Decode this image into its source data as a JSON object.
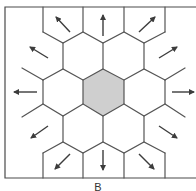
{
  "figure": {
    "panel_label": "B",
    "colors": {
      "center_fill": "#cfcfcf",
      "stroke": "#555555",
      "arrow": "#3c3c3c",
      "background": "#ffffff"
    }
  }
}
